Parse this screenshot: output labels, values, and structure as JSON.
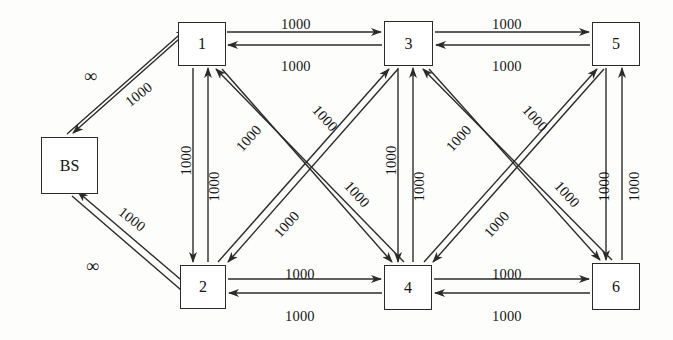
{
  "diagram": {
    "type": "directed-graph",
    "stroke_color": "#2b2b2b",
    "background_color": "#fdfdfc",
    "infinity_symbol": "∞",
    "default_capacity": "1000"
  },
  "nodes": [
    {
      "id": "BS",
      "label": "BS",
      "x": 41,
      "y": 137,
      "w": 57,
      "h": 57
    },
    {
      "id": "1",
      "label": "1",
      "x": 178,
      "y": 22,
      "w": 48,
      "h": 44
    },
    {
      "id": "3",
      "label": "3",
      "x": 384,
      "y": 21,
      "w": 49,
      "h": 45
    },
    {
      "id": "5",
      "label": "5",
      "x": 592,
      "y": 22,
      "w": 48,
      "h": 44
    },
    {
      "id": "2",
      "label": "2",
      "x": 180,
      "y": 265,
      "w": 46,
      "h": 44
    },
    {
      "id": "4",
      "label": "4",
      "x": 384,
      "y": 265,
      "w": 48,
      "h": 45
    },
    {
      "id": "6",
      "label": "6",
      "x": 592,
      "y": 263,
      "w": 48,
      "h": 47
    }
  ],
  "links": [
    {
      "from": "BS",
      "to": "1",
      "capacity": "1000"
    },
    {
      "from": "1",
      "to": "BS",
      "capacity": "∞"
    },
    {
      "from": "BS",
      "to": "2",
      "capacity": "1000"
    },
    {
      "from": "2",
      "to": "BS",
      "capacity": "∞"
    },
    {
      "from": "1",
      "to": "3",
      "capacity": "1000"
    },
    {
      "from": "3",
      "to": "1",
      "capacity": "1000"
    },
    {
      "from": "3",
      "to": "5",
      "capacity": "1000"
    },
    {
      "from": "5",
      "to": "3",
      "capacity": "1000"
    },
    {
      "from": "2",
      "to": "4",
      "capacity": "1000"
    },
    {
      "from": "4",
      "to": "2",
      "capacity": "1000"
    },
    {
      "from": "4",
      "to": "6",
      "capacity": "1000"
    },
    {
      "from": "6",
      "to": "4",
      "capacity": "1000"
    },
    {
      "from": "1",
      "to": "2",
      "capacity": "1000"
    },
    {
      "from": "2",
      "to": "1",
      "capacity": "1000"
    },
    {
      "from": "3",
      "to": "4",
      "capacity": "1000"
    },
    {
      "from": "4",
      "to": "3",
      "capacity": "1000"
    },
    {
      "from": "5",
      "to": "6",
      "capacity": "1000"
    },
    {
      "from": "6",
      "to": "5",
      "capacity": "1000"
    },
    {
      "from": "1",
      "to": "4",
      "capacity": "1000"
    },
    {
      "from": "4",
      "to": "1",
      "capacity": "1000"
    },
    {
      "from": "2",
      "to": "3",
      "capacity": "1000"
    },
    {
      "from": "3",
      "to": "2",
      "capacity": "1000"
    },
    {
      "from": "3",
      "to": "6",
      "capacity": "1000"
    },
    {
      "from": "6",
      "to": "3",
      "capacity": "1000"
    },
    {
      "from": "4",
      "to": "5",
      "capacity": "1000"
    },
    {
      "from": "5",
      "to": "4",
      "capacity": "1000"
    }
  ],
  "labels": [
    {
      "name": "label-bs-1-infinity",
      "text": "∞",
      "x": 84,
      "y": 66,
      "rot": 0,
      "big": true
    },
    {
      "name": "label-bs-1-capacity",
      "text": "1000",
      "x": 124,
      "y": 86,
      "rot": -38,
      "big": false
    },
    {
      "name": "label-bs-2-capacity",
      "text": "1000",
      "x": 117,
      "y": 211,
      "rot": 38,
      "big": false
    },
    {
      "name": "label-bs-2-infinity",
      "text": "∞",
      "x": 86,
      "y": 256,
      "rot": 0,
      "big": true
    },
    {
      "name": "label-1-3-top",
      "text": "1000",
      "x": 281,
      "y": 16,
      "rot": 0,
      "big": false
    },
    {
      "name": "label-3-1-bottom",
      "text": "1000",
      "x": 281,
      "y": 58,
      "rot": 0,
      "big": false
    },
    {
      "name": "label-3-5-top",
      "text": "1000",
      "x": 492,
      "y": 16,
      "rot": 0,
      "big": false
    },
    {
      "name": "label-5-3-bottom",
      "text": "1000",
      "x": 492,
      "y": 58,
      "rot": 0,
      "big": false
    },
    {
      "name": "label-2-4-top",
      "text": "1000",
      "x": 285,
      "y": 266,
      "rot": 0,
      "big": false
    },
    {
      "name": "label-4-2-bottom",
      "text": "1000",
      "x": 285,
      "y": 308,
      "rot": 0,
      "big": false
    },
    {
      "name": "label-4-6-top",
      "text": "1000",
      "x": 492,
      "y": 266,
      "rot": 0,
      "big": false
    },
    {
      "name": "label-6-4-bottom",
      "text": "1000",
      "x": 492,
      "y": 308,
      "rot": 0,
      "big": false
    },
    {
      "name": "label-1-2-left",
      "text": "1000",
      "x": 172,
      "y": 152,
      "rot": -90,
      "big": false
    },
    {
      "name": "label-2-1-right",
      "text": "1000",
      "x": 200,
      "y": 178,
      "rot": -90,
      "big": false
    },
    {
      "name": "label-3-4-left",
      "text": "1000",
      "x": 377,
      "y": 152,
      "rot": -90,
      "big": false
    },
    {
      "name": "label-4-3-right",
      "text": "1000",
      "x": 405,
      "y": 178,
      "rot": -90,
      "big": false
    },
    {
      "name": "label-5-6-left",
      "text": "1000",
      "x": 590,
      "y": 178,
      "rot": -90,
      "big": false
    },
    {
      "name": "label-6-5-right",
      "text": "1000",
      "x": 620,
      "y": 178,
      "rot": -90,
      "big": false
    },
    {
      "name": "label-1-4-upper",
      "text": "1000",
      "x": 310,
      "y": 110,
      "rot": 48,
      "big": false
    },
    {
      "name": "label-1-4-lower",
      "text": "1000",
      "x": 342,
      "y": 186,
      "rot": 48,
      "big": false
    },
    {
      "name": "label-2-3-upper",
      "text": "1000",
      "x": 234,
      "y": 130,
      "rot": -48,
      "big": false
    },
    {
      "name": "label-2-3-lower",
      "text": "1000",
      "x": 272,
      "y": 216,
      "rot": -48,
      "big": false
    },
    {
      "name": "label-3-6-upper",
      "text": "1000",
      "x": 520,
      "y": 110,
      "rot": 48,
      "big": false
    },
    {
      "name": "label-3-6-lower",
      "text": "1000",
      "x": 552,
      "y": 186,
      "rot": 48,
      "big": false
    },
    {
      "name": "label-4-5-upper",
      "text": "1000",
      "x": 444,
      "y": 130,
      "rot": -48,
      "big": false
    },
    {
      "name": "label-4-5-lower",
      "text": "1000",
      "x": 482,
      "y": 216,
      "rot": -48,
      "big": false
    }
  ],
  "edge_geometry": [
    {
      "name": "bs-1-out",
      "x1": 67,
      "y1": 134,
      "x2": 186,
      "y2": 29,
      "arrow": "end"
    },
    {
      "name": "bs-1-in",
      "x1": 196,
      "y1": 24,
      "x2": 73,
      "y2": 133,
      "arrow": "end"
    },
    {
      "name": "bs-2-out",
      "x1": 72,
      "y1": 196,
      "x2": 195,
      "y2": 302,
      "arrow": "end"
    },
    {
      "name": "bs-2-in",
      "x1": 200,
      "y1": 296,
      "x2": 78,
      "y2": 192,
      "arrow": "end"
    },
    {
      "name": "1-3-out",
      "x1": 227,
      "y1": 32,
      "x2": 381,
      "y2": 32,
      "arrow": "end"
    },
    {
      "name": "3-1-in",
      "x1": 382,
      "y1": 45,
      "x2": 228,
      "y2": 45,
      "arrow": "end"
    },
    {
      "name": "3-5-out",
      "x1": 435,
      "y1": 32,
      "x2": 589,
      "y2": 32,
      "arrow": "end"
    },
    {
      "name": "5-3-in",
      "x1": 590,
      "y1": 45,
      "x2": 436,
      "y2": 45,
      "arrow": "end"
    },
    {
      "name": "2-4-out",
      "x1": 228,
      "y1": 279,
      "x2": 381,
      "y2": 279,
      "arrow": "end"
    },
    {
      "name": "4-2-in",
      "x1": 382,
      "y1": 293,
      "x2": 229,
      "y2": 293,
      "arrow": "end"
    },
    {
      "name": "4-6-out",
      "x1": 434,
      "y1": 279,
      "x2": 589,
      "y2": 279,
      "arrow": "end"
    },
    {
      "name": "6-5-in",
      "x1": 590,
      "y1": 293,
      "x2": 435,
      "y2": 293,
      "arrow": "end"
    },
    {
      "name": "1-2-down",
      "x1": 193,
      "y1": 68,
      "x2": 193,
      "y2": 262,
      "arrow": "end"
    },
    {
      "name": "2-1-up",
      "x1": 208,
      "y1": 262,
      "x2": 208,
      "y2": 68,
      "arrow": "end"
    },
    {
      "name": "3-4-down",
      "x1": 398,
      "y1": 68,
      "x2": 398,
      "y2": 262,
      "arrow": "end"
    },
    {
      "name": "4-3-up",
      "x1": 413,
      "y1": 262,
      "x2": 413,
      "y2": 68,
      "arrow": "end"
    },
    {
      "name": "5-6-down",
      "x1": 606,
      "y1": 68,
      "x2": 606,
      "y2": 260,
      "arrow": "end"
    },
    {
      "name": "6-5-up",
      "x1": 622,
      "y1": 260,
      "x2": 622,
      "y2": 68,
      "arrow": "end"
    },
    {
      "name": "1-4-down",
      "x1": 222,
      "y1": 69,
      "x2": 392,
      "y2": 262,
      "arrow": "end"
    },
    {
      "name": "4-1-up",
      "x1": 404,
      "y1": 262,
      "x2": 216,
      "y2": 69,
      "arrow": "end"
    },
    {
      "name": "2-3-up",
      "x1": 218,
      "y1": 262,
      "x2": 389,
      "y2": 69,
      "arrow": "end"
    },
    {
      "name": "3-2-down",
      "x1": 398,
      "y1": 69,
      "x2": 228,
      "y2": 262,
      "arrow": "end"
    },
    {
      "name": "3-6-down",
      "x1": 429,
      "y1": 69,
      "x2": 600,
      "y2": 260,
      "arrow": "end"
    },
    {
      "name": "6-3-up",
      "x1": 612,
      "y1": 260,
      "x2": 423,
      "y2": 69,
      "arrow": "end"
    },
    {
      "name": "4-5-up",
      "x1": 424,
      "y1": 262,
      "x2": 597,
      "y2": 69,
      "arrow": "end"
    },
    {
      "name": "5-4-down",
      "x1": 604,
      "y1": 69,
      "x2": 433,
      "y2": 262,
      "arrow": "end"
    }
  ]
}
